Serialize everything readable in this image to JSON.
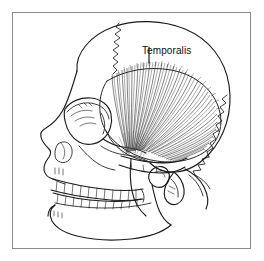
{
  "figure": {
    "type": "anatomical-line-drawing",
    "background_color": "#ffffff",
    "ink_color": "#1b1b1b",
    "frame": {
      "border_color": "#8a8a8a",
      "border_width_px": 1,
      "x": 12,
      "y": 12,
      "width": 239,
      "height": 237
    },
    "labels": [
      {
        "id": "temporalis",
        "text": "Temporalis",
        "x": 129,
        "y": 32,
        "font_size_px": 10,
        "color": "#0d0d0d",
        "leader": {
          "from_x": 148,
          "from_y": 46,
          "to_x": 148,
          "to_y": 62
        }
      }
    ],
    "structures": [
      "cranial vault",
      "coronal suture",
      "lambdoid suture",
      "frontal bone",
      "orbit",
      "nasal aperture",
      "zygomatic arch",
      "maxilla",
      "mandible",
      "mandibular ramus",
      "mandibular condyle",
      "coronoid process",
      "mastoid process",
      "external acoustic meatus",
      "upper teeth row",
      "lower teeth row",
      "temporalis muscle fan"
    ]
  }
}
